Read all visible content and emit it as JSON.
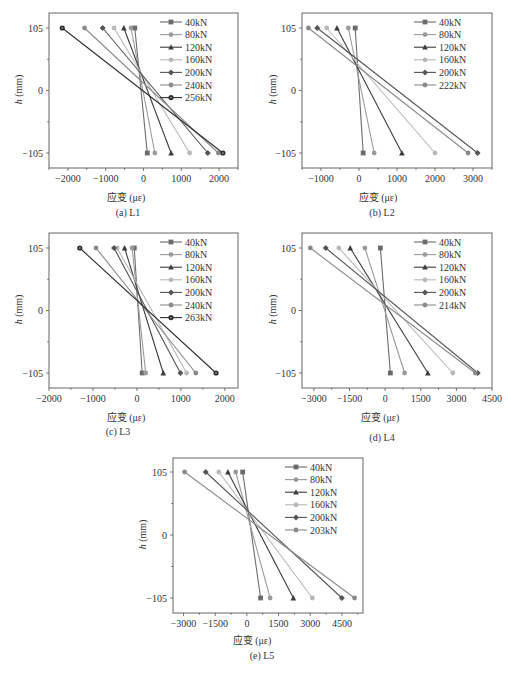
{
  "figure": {
    "xlabel": "应变 (με)",
    "ylabel_var": "h",
    "ylabel_unit": " (mm)",
    "yticks": [
      "105",
      "0",
      "-105"
    ]
  },
  "chart_data": [
    {
      "type": "line",
      "title": "(a) L1",
      "xlabel": "应变 (με)",
      "ylabel": "h (mm)",
      "xticks": [
        -2000,
        -1000,
        0,
        1000,
        2000
      ],
      "xlim": [
        -2500,
        2500
      ],
      "yticks": [
        105,
        0,
        -105
      ],
      "ylim": [
        -125,
        125
      ],
      "y": [
        105,
        -105
      ],
      "legend_position": "upper right",
      "grid": false,
      "series": [
        {
          "name": "40kN",
          "marker": "square",
          "color": "#6b6b6b",
          "values": [
            -230,
            100
          ]
        },
        {
          "name": "80kN",
          "marker": "circle",
          "color": "#9a9a9a",
          "values": [
            -330,
            300
          ]
        },
        {
          "name": "120kN",
          "marker": "triangle",
          "color": "#3d3d3d",
          "values": [
            -520,
            730
          ]
        },
        {
          "name": "160kN",
          "marker": "circle",
          "color": "#b8b8b8",
          "values": [
            -780,
            1220
          ]
        },
        {
          "name": "200kN",
          "marker": "diamond",
          "color": "#555555",
          "values": [
            -1080,
            1700
          ]
        },
        {
          "name": "240kN",
          "marker": "circle",
          "color": "#8a8a8a",
          "values": [
            -1560,
            1980
          ]
        },
        {
          "name": "256kN",
          "marker": "hexagon",
          "color": "#2e2e2e",
          "values": [
            -2150,
            2100
          ]
        }
      ]
    },
    {
      "type": "line",
      "title": "(b) L2",
      "xlabel": "应变 (με)",
      "ylabel": "h (mm)",
      "xticks": [
        -1000,
        0,
        1000,
        2000,
        3000
      ],
      "xlim": [
        -1500,
        3500
      ],
      "yticks": [
        105,
        0,
        -105
      ],
      "ylim": [
        -125,
        125
      ],
      "y": [
        105,
        -105
      ],
      "legend_position": "upper right",
      "grid": false,
      "series": [
        {
          "name": "40kN",
          "marker": "square",
          "color": "#6b6b6b",
          "values": [
            -100,
            110
          ]
        },
        {
          "name": "80kN",
          "marker": "circle",
          "color": "#9a9a9a",
          "values": [
            -280,
            400
          ]
        },
        {
          "name": "120kN",
          "marker": "triangle",
          "color": "#3d3d3d",
          "values": [
            -580,
            1130
          ]
        },
        {
          "name": "160kN",
          "marker": "circle",
          "color": "#b8b8b8",
          "values": [
            -850,
            2000
          ]
        },
        {
          "name": "200kN",
          "marker": "diamond",
          "color": "#555555",
          "values": [
            -1100,
            3120
          ]
        },
        {
          "name": "222kN",
          "marker": "circle",
          "color": "#8a8a8a",
          "values": [
            -1330,
            2870
          ]
        }
      ]
    },
    {
      "type": "line",
      "title": "(c) L3",
      "xlabel": "应变 (με)",
      "ylabel": "h (mm)",
      "xticks": [
        -2000,
        -1000,
        0,
        1000,
        2000
      ],
      "xlim": [
        -2000,
        2300
      ],
      "yticks": [
        105,
        0,
        -105
      ],
      "ylim": [
        -125,
        125
      ],
      "y": [
        105,
        -105
      ],
      "legend_position": "upper right",
      "grid": false,
      "series": [
        {
          "name": "40kN",
          "marker": "square",
          "color": "#6b6b6b",
          "values": [
            -60,
            120
          ]
        },
        {
          "name": "80kN",
          "marker": "circle",
          "color": "#9a9a9a",
          "values": [
            -110,
            200
          ]
        },
        {
          "name": "120kN",
          "marker": "triangle",
          "color": "#3d3d3d",
          "values": [
            -280,
            600
          ]
        },
        {
          "name": "160kN",
          "marker": "circle",
          "color": "#b8b8b8",
          "values": [
            -450,
            1130
          ]
        },
        {
          "name": "200kN",
          "marker": "diamond",
          "color": "#555555",
          "values": [
            -520,
            990
          ]
        },
        {
          "name": "240kN",
          "marker": "circle",
          "color": "#8a8a8a",
          "values": [
            -930,
            1340
          ]
        },
        {
          "name": "263kN",
          "marker": "hexagon",
          "color": "#2e2e2e",
          "values": [
            -1300,
            1800
          ]
        }
      ]
    },
    {
      "type": "line",
      "title": "(d) L4",
      "xlabel": "应变 (με)",
      "ylabel": "h (mm)",
      "xticks": [
        -3000,
        -1500,
        0,
        1500,
        3000,
        4500
      ],
      "xlim": [
        -3500,
        4500
      ],
      "yticks": [
        105,
        0,
        -105
      ],
      "ylim": [
        -125,
        125
      ],
      "y": [
        105,
        -105
      ],
      "legend_position": "upper right",
      "grid": false,
      "series": [
        {
          "name": "40kN",
          "marker": "square",
          "color": "#6b6b6b",
          "values": [
            -200,
            220
          ]
        },
        {
          "name": "80kN",
          "marker": "circle",
          "color": "#9a9a9a",
          "values": [
            -850,
            820
          ]
        },
        {
          "name": "120kN",
          "marker": "triangle",
          "color": "#3d3d3d",
          "values": [
            -1470,
            1800
          ]
        },
        {
          "name": "160kN",
          "marker": "circle",
          "color": "#b8b8b8",
          "values": [
            -1950,
            2850
          ]
        },
        {
          "name": "200kN",
          "marker": "diamond",
          "color": "#555555",
          "values": [
            -2500,
            3900
          ]
        },
        {
          "name": "214kN",
          "marker": "circle",
          "color": "#8a8a8a",
          "values": [
            -3150,
            3800
          ]
        }
      ]
    },
    {
      "type": "line",
      "title": "(e) L5",
      "xlabel": "应变 (με)",
      "ylabel": "h (mm)",
      "xticks": [
        -3000,
        -1500,
        0,
        1500,
        3000,
        4500
      ],
      "xlim": [
        -3500,
        5500
      ],
      "yticks": [
        105,
        0,
        -105
      ],
      "ylim": [
        -125,
        125
      ],
      "y": [
        105,
        -105
      ],
      "legend_position": "upper right",
      "grid": false,
      "series": [
        {
          "name": "40kN",
          "marker": "square",
          "color": "#6b6b6b",
          "values": [
            -200,
            650
          ]
        },
        {
          "name": "80kN",
          "marker": "circle",
          "color": "#9a9a9a",
          "values": [
            -530,
            1100
          ]
        },
        {
          "name": "120kN",
          "marker": "triangle",
          "color": "#3d3d3d",
          "values": [
            -900,
            2200
          ]
        },
        {
          "name": "160kN",
          "marker": "circle",
          "color": "#b8b8b8",
          "values": [
            -1330,
            3100
          ]
        },
        {
          "name": "200kN",
          "marker": "diamond",
          "color": "#555555",
          "values": [
            -1950,
            4500
          ]
        },
        {
          "name": "203kN",
          "marker": "circle",
          "color": "#8a8a8a",
          "values": [
            -2950,
            5100
          ]
        }
      ]
    }
  ]
}
